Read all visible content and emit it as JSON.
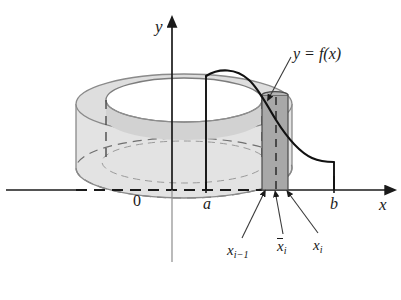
{
  "figure": {
    "background_color": "#ffffff",
    "ink_color": "#1a1a1a"
  },
  "axes": {
    "y_axis_label": "y",
    "x_axis_label": "x",
    "origin_label": "0",
    "tick_labels": {
      "a": "a",
      "b": "b"
    }
  },
  "curve": {
    "label": "y = f(x)",
    "stroke_color": "#111111",
    "stroke_width": 2.2
  },
  "shell": {
    "left_label": "x",
    "left_label_sub": "i − 1",
    "mid_label": "x",
    "mid_label_sub": "i",
    "right_label": "x",
    "right_label_sub": "i",
    "fill_color": "#a8a8a8",
    "edge_color": "#4a4a4a"
  },
  "solid": {
    "body_fill": "#e3e3e3",
    "top_fill": "#dedede",
    "inner_fill": "#d2d2d2",
    "outline_color": "#8a8a8a"
  },
  "labels": {
    "y": "y",
    "x": "x",
    "zero": "0",
    "a": "a",
    "b": "b",
    "curve_equation": "y = f(x)",
    "x_i_minus_1": "x",
    "x_i_minus_1_sub": "i−1",
    "x_bar_i": "x",
    "x_bar_i_sub": "i",
    "x_i": "x",
    "x_i_sub": "i"
  }
}
